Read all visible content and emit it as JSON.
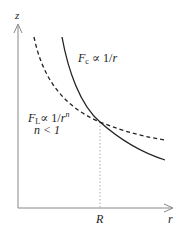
{
  "axes": {
    "y_label": "z",
    "x_label": "r",
    "x_tick_label": "R"
  },
  "curves": {
    "central": {
      "label_F": "F",
      "label_sub": "c",
      "label_rel": " ∝ 1/",
      "label_var": "r",
      "style": "solid"
    },
    "local": {
      "label_F": "F",
      "label_sub": "L",
      "label_rel": "∝ 1/",
      "label_var": "r",
      "label_exp": "n",
      "condition": "n < 1",
      "style": "dashed"
    }
  },
  "colors": {
    "axis": "#888888",
    "curve": "#222222",
    "dotted_guide": "#aaaaaa"
  }
}
